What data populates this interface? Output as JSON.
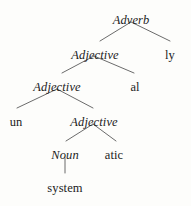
{
  "figure": {
    "word": "unsystematically",
    "background_color": "#fdfdfb",
    "ink_color": "#1c1c1c",
    "edge_color": "#5a5a5a"
  },
  "nodes": [
    {
      "id": "adverb",
      "label": "Adverb",
      "kind": "category",
      "style": "italic",
      "x": 131,
      "y": 14
    },
    {
      "id": "adj1",
      "label": "Adjective",
      "kind": "category",
      "style": "italic",
      "x": 95,
      "y": 49
    },
    {
      "id": "ly",
      "label": "ly",
      "kind": "morpheme",
      "style": "roman",
      "x": 170,
      "y": 49
    },
    {
      "id": "adj2",
      "label": "Adjective",
      "kind": "category",
      "style": "italic",
      "x": 57,
      "y": 81
    },
    {
      "id": "al",
      "label": "al",
      "kind": "morpheme",
      "style": "roman",
      "x": 135,
      "y": 81
    },
    {
      "id": "un",
      "label": "un",
      "kind": "morpheme",
      "style": "roman",
      "x": 16,
      "y": 116
    },
    {
      "id": "adj3",
      "label": "Adjective",
      "kind": "category",
      "style": "italic",
      "x": 94,
      "y": 116
    },
    {
      "id": "noun",
      "label": "Noun",
      "kind": "category",
      "style": "italic",
      "x": 65,
      "y": 149
    },
    {
      "id": "atic",
      "label": "atic",
      "kind": "morpheme",
      "style": "roman",
      "x": 114,
      "y": 149
    },
    {
      "id": "system",
      "label": "system",
      "kind": "morpheme",
      "style": "roman",
      "x": 65,
      "y": 182
    }
  ],
  "edges": [
    {
      "from": "adverb",
      "to": "adj1",
      "x1": 131,
      "y1": 22,
      "x2": 100,
      "y2": 41
    },
    {
      "from": "adverb",
      "to": "ly",
      "x1": 131,
      "y1": 22,
      "x2": 170,
      "y2": 41
    },
    {
      "from": "adj1",
      "to": "adj2",
      "x1": 94,
      "y1": 56,
      "x2": 62,
      "y2": 73
    },
    {
      "from": "adj1",
      "to": "al",
      "x1": 94,
      "y1": 56,
      "x2": 134,
      "y2": 73
    },
    {
      "from": "adj2",
      "to": "un",
      "x1": 57,
      "y1": 89,
      "x2": 17,
      "y2": 108
    },
    {
      "from": "adj2",
      "to": "adj3",
      "x1": 57,
      "y1": 89,
      "x2": 93,
      "y2": 108
    },
    {
      "from": "adj3",
      "to": "noun",
      "x1": 93,
      "y1": 124,
      "x2": 66,
      "y2": 141
    },
    {
      "from": "adj3",
      "to": "atic",
      "x1": 93,
      "y1": 124,
      "x2": 116,
      "y2": 141
    },
    {
      "from": "noun",
      "to": "system",
      "x1": 65,
      "y1": 158,
      "x2": 65,
      "y2": 173
    }
  ]
}
